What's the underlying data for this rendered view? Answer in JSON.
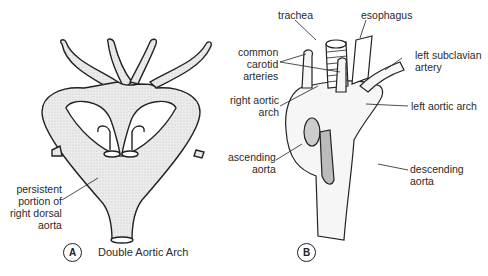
{
  "panel_a": {
    "marker": "A",
    "caption": "Double Aortic Arch",
    "labels": {
      "persistent_dorsal_aorta": [
        "persistent",
        "portion of",
        "right dorsal",
        "aorta"
      ]
    }
  },
  "panel_b": {
    "marker": "B",
    "labels": {
      "trachea": "trachea",
      "esophagus": "esophagus",
      "common_carotid": [
        "common",
        "carotid",
        "arteries"
      ],
      "left_subclavian": [
        "left subclavian",
        "artery"
      ],
      "right_aortic_arch": [
        "right aortic",
        "arch"
      ],
      "left_aortic_arch": "left aortic arch",
      "ascending_aorta": [
        "ascending",
        "aorta"
      ],
      "descending_aorta": [
        "descending",
        "aorta"
      ]
    }
  },
  "colors": {
    "line": "#222222",
    "fill": "#e6e6e6",
    "background": "#ffffff"
  }
}
